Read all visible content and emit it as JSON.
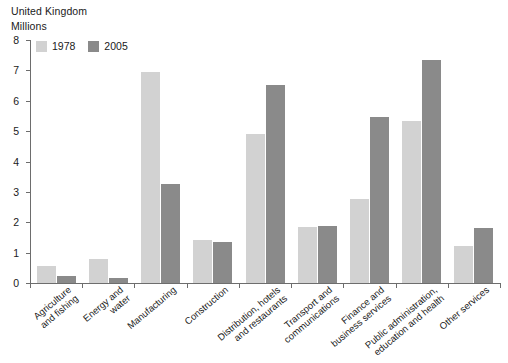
{
  "header": {
    "country": "United Kingdom",
    "units": "Millions"
  },
  "chart_data": {
    "type": "bar",
    "title": "United Kingdom",
    "subtitle": "Millions",
    "xlabel": "",
    "ylabel": "Millions",
    "ylim": [
      0,
      8
    ],
    "ytick_labels": [
      "8",
      "7",
      "6",
      "5",
      "4",
      "3",
      "2",
      "1",
      "0"
    ],
    "yticks": [
      8,
      7,
      6,
      5,
      4,
      3,
      2,
      1,
      0
    ],
    "grid": false,
    "legend_position": "top-left",
    "categories": [
      "Agriculture and fishing",
      "Energy and water",
      "Manufacturing",
      "Construction",
      "Distribution, hotels and restaurants",
      "Transport and communications",
      "Finance and business services",
      "Public administration, education and health",
      "Other services"
    ],
    "category_lines": [
      [
        "Agriculture",
        "and fishing"
      ],
      [
        "Energy and",
        "water"
      ],
      [
        "Manufacturing"
      ],
      [
        "Construction"
      ],
      [
        "Distribution, hotels",
        "and restaurants"
      ],
      [
        "Transport and",
        "communications"
      ],
      [
        "Finance and",
        "business services"
      ],
      [
        "Public administration,",
        "education and health"
      ],
      [
        "Other services"
      ]
    ],
    "series": [
      {
        "name": "1978",
        "color": "#d2d2d2",
        "values": [
          0.55,
          0.78,
          6.95,
          1.42,
          4.9,
          1.85,
          2.77,
          5.33,
          1.22
        ]
      },
      {
        "name": "2005",
        "color": "#8a8a8a",
        "values": [
          0.23,
          0.18,
          3.27,
          1.35,
          6.52,
          1.88,
          5.46,
          7.33,
          1.8
        ]
      }
    ]
  }
}
